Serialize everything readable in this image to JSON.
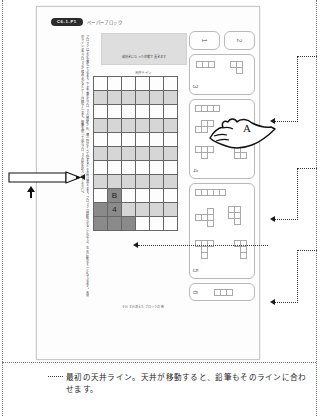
{
  "document": {
    "kind": "scanned-manual-page",
    "header": {
      "badge": "C6-1-P1",
      "subtitle": "ペーパーブロック"
    },
    "vertical_text": "ブロックは上から落ちてきます。下まで落ちたブロックは固定され、横一列がすべて埋まるとその列は消えます。ブロックは回転させることができ、左右に動かすこともできます。天井のラインまでブロックが積み上がるとゲームは終了します。鉛筆を使って出たブロックの形を記入してください。",
    "grey_box_note": "縦向きになった状態で置きます",
    "grid_label": "天井ライン",
    "grid_caption": "それぞれ消えたブロックの数",
    "grid": {
      "columns": 6,
      "rows": 11,
      "cell_size_px": 14,
      "shaded_rows": [
        1,
        3,
        5,
        7,
        9
      ],
      "marks": [
        {
          "label": "B",
          "row": 8,
          "col": 1,
          "fill": "light"
        },
        {
          "label": "4",
          "row": 9,
          "col": 1,
          "fill": "dark"
        }
      ],
      "dark_cells": [
        {
          "row": 8,
          "col": 1
        },
        {
          "row": 9,
          "col": 0
        },
        {
          "row": 9,
          "col": 1
        },
        {
          "row": 10,
          "col": 0
        },
        {
          "row": 10,
          "col": 1
        },
        {
          "row": 10,
          "col": 2
        }
      ]
    }
  },
  "panels": [
    {
      "number": "1",
      "shapes": []
    },
    {
      "number": "2",
      "shapes": []
    },
    {
      "number": "3",
      "shapes": [
        "I3",
        "L3"
      ]
    },
    {
      "number": "4",
      "shapes": [
        "I4",
        "O4",
        "T4",
        "S4",
        "L4"
      ]
    },
    {
      "number": "5",
      "shapes": [
        "I5",
        "P5",
        "U5",
        "T5",
        "Z5",
        "L5"
      ]
    },
    {
      "number": "6",
      "shapes": [
        "mixed"
      ]
    }
  ],
  "annotations": {
    "hand_label": "A",
    "pencil_name": "鉛筆",
    "caption": "最初の天井ライン。天井が移動すると、鉛筆もそのラインに合わせます。"
  },
  "colors": {
    "page_bg": "#fdfdfd",
    "grid_line": "#666666",
    "shade": "#d6d6d6",
    "dark": "#8a8a8a",
    "badge_bg": "#2b2b2b",
    "panel_border": "#b9b9b9",
    "annotation": "#1a1a1a"
  }
}
